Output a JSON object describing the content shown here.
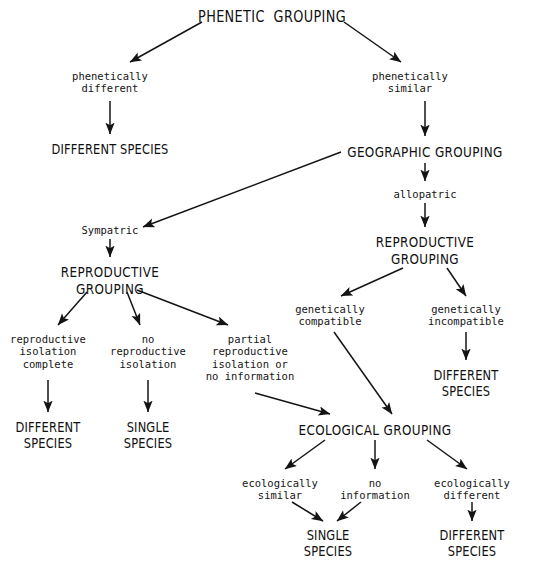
{
  "diagram": {
    "title": "PHENETIC GROUPING",
    "type": "flowchart",
    "background_color": "#ffffff",
    "ink_color": "#101010"
  },
  "nodes": {
    "phenetic_grouping": {
      "label": "PHENETIC  GROUPING",
      "x": 272,
      "y": 8,
      "style": "caps big"
    },
    "phenetically_different": {
      "label": "phenetically\ndifferent",
      "x": 110,
      "y": 70,
      "style": "cond"
    },
    "phenetically_similar": {
      "label": "phenetically\nsimilar",
      "x": 410,
      "y": 70,
      "style": "cond"
    },
    "different_species_1": {
      "label": "DIFFERENT SPECIES",
      "x": 110,
      "y": 142,
      "style": "term"
    },
    "geographic_grouping": {
      "label": "GEOGRAPHIC GROUPING",
      "x": 425,
      "y": 144,
      "style": "caps"
    },
    "allopatric": {
      "label": "allopatric",
      "x": 425,
      "y": 188,
      "style": "cond"
    },
    "reproductive_grouping_right": {
      "label": "REPRODUCTIVE\nGROUPING",
      "x": 425,
      "y": 234,
      "style": "caps"
    },
    "sympatric": {
      "label": "Sympatric",
      "x": 110,
      "y": 224,
      "style": "cond"
    },
    "reproductive_grouping_left": {
      "label": "REPRODUCTIVE\nGROUPING",
      "x": 110,
      "y": 264,
      "style": "caps"
    },
    "reproductive_isolation_complete": {
      "label": "reproductive\nisolation\ncomplete",
      "x": 48,
      "y": 333,
      "style": "cond"
    },
    "no_reproductive_isolation": {
      "label": "no\nreproductive\nisolation",
      "x": 148,
      "y": 333,
      "style": "cond"
    },
    "partial_reproductive_isolation": {
      "label": "partial\nreproductive\nisolation or\nno information",
      "x": 250,
      "y": 333,
      "style": "cond"
    },
    "different_species_2": {
      "label": "DIFFERENT\nSPECIES",
      "x": 48,
      "y": 420,
      "style": "term"
    },
    "single_species_1": {
      "label": "SINGLE\nSPECIES",
      "x": 148,
      "y": 420,
      "style": "term"
    },
    "genetically_compatible": {
      "label": "genetically\ncompatible",
      "x": 330,
      "y": 303,
      "style": "cond"
    },
    "genetically_incompatible": {
      "label": "genetically\nincompatible",
      "x": 466,
      "y": 303,
      "style": "cond"
    },
    "different_species_3": {
      "label": "DIFFERENT\nSPECIES",
      "x": 466,
      "y": 368,
      "style": "term"
    },
    "ecological_grouping": {
      "label": "ECOLOGICAL GROUPING",
      "x": 375,
      "y": 422,
      "style": "caps"
    },
    "ecologically_similar": {
      "label": "ecologically\nsimilar",
      "x": 280,
      "y": 477,
      "style": "cond"
    },
    "no_information": {
      "label": "no\ninformation",
      "x": 375,
      "y": 477,
      "style": "cond"
    },
    "ecologically_different": {
      "label": "ecologically\ndifferent",
      "x": 472,
      "y": 477,
      "style": "cond"
    },
    "single_species_2": {
      "label": "SINGLE\nSPECIES",
      "x": 328,
      "y": 528,
      "style": "term"
    },
    "different_species_4": {
      "label": "DIFFERENT\nSPECIES",
      "x": 472,
      "y": 528,
      "style": "term"
    }
  },
  "edges": [
    {
      "name": "phenetic-to-different",
      "from": "phenetic_grouping",
      "to": "phenetically_different",
      "x1": 202,
      "y1": 22,
      "x2": 130,
      "y2": 62
    },
    {
      "name": "phenetic-to-similar",
      "from": "phenetic_grouping",
      "to": "phenetically_similar",
      "x1": 344,
      "y1": 22,
      "x2": 401,
      "y2": 62
    },
    {
      "name": "different-to-species",
      "from": "phenetically_different",
      "to": "different_species_1",
      "x1": 110,
      "y1": 101,
      "x2": 110,
      "y2": 134
    },
    {
      "name": "similar-to-geographic",
      "from": "phenetically_similar",
      "to": "geographic_grouping",
      "x1": 425,
      "y1": 101,
      "x2": 425,
      "y2": 136
    },
    {
      "name": "geographic-to-sympatric",
      "from": "geographic_grouping",
      "to": "sympatric",
      "x1": 341,
      "y1": 152,
      "x2": 143,
      "y2": 227
    },
    {
      "name": "geographic-to-allopatric",
      "from": "geographic_grouping",
      "to": "allopatric",
      "x1": 425,
      "y1": 163,
      "x2": 425,
      "y2": 181
    },
    {
      "name": "allopatric-to-reproductive",
      "from": "allopatric",
      "to": "reproductive_grouping_right",
      "x1": 425,
      "y1": 203,
      "x2": 425,
      "y2": 227
    },
    {
      "name": "sympatric-to-reproductive",
      "from": "sympatric",
      "to": "reproductive_grouping_left",
      "x1": 110,
      "y1": 239,
      "x2": 110,
      "y2": 257
    },
    {
      "name": "reproductive-left-to-isolation-complete",
      "from": "reproductive_grouping_left",
      "to": "reproductive_isolation_complete",
      "x1": 87,
      "y1": 292,
      "x2": 58,
      "y2": 325
    },
    {
      "name": "reproductive-left-to-no-isolation",
      "from": "reproductive_grouping_left",
      "to": "no_reproductive_isolation",
      "x1": 127,
      "y1": 292,
      "x2": 140,
      "y2": 325
    },
    {
      "name": "reproductive-left-to-partial",
      "from": "reproductive_grouping_left",
      "to": "partial_reproductive_isolation",
      "x1": 137,
      "y1": 290,
      "x2": 228,
      "y2": 325
    },
    {
      "name": "isolation-complete-to-different-species",
      "from": "reproductive_isolation_complete",
      "to": "different_species_2",
      "x1": 48,
      "y1": 380,
      "x2": 48,
      "y2": 412
    },
    {
      "name": "no-isolation-to-single-species",
      "from": "no_reproductive_isolation",
      "to": "single_species_1",
      "x1": 148,
      "y1": 380,
      "x2": 148,
      "y2": 412
    },
    {
      "name": "partial-to-ecological",
      "from": "partial_reproductive_isolation",
      "to": "ecological_grouping",
      "x1": 255,
      "y1": 393,
      "x2": 330,
      "y2": 414
    },
    {
      "name": "reproductive-right-to-compatible",
      "from": "reproductive_grouping_right",
      "to": "genetically_compatible",
      "x1": 403,
      "y1": 268,
      "x2": 341,
      "y2": 296
    },
    {
      "name": "reproductive-right-to-incompatible",
      "from": "reproductive_grouping_right",
      "to": "genetically_incompatible",
      "x1": 447,
      "y1": 268,
      "x2": 466,
      "y2": 296
    },
    {
      "name": "incompatible-to-different-species",
      "from": "genetically_incompatible",
      "to": "different_species_3",
      "x1": 466,
      "y1": 332,
      "x2": 466,
      "y2": 360
    },
    {
      "name": "compatible-to-ecological",
      "from": "genetically_compatible",
      "to": "ecological_grouping",
      "x1": 334,
      "y1": 332,
      "x2": 392,
      "y2": 414
    },
    {
      "name": "ecological-to-similar",
      "from": "ecological_grouping",
      "to": "ecologically_similar",
      "x1": 325,
      "y1": 440,
      "x2": 285,
      "y2": 469
    },
    {
      "name": "ecological-to-no-information",
      "from": "ecological_grouping",
      "to": "no_information",
      "x1": 375,
      "y1": 440,
      "x2": 375,
      "y2": 469
    },
    {
      "name": "ecological-to-different",
      "from": "ecological_grouping",
      "to": "ecologically_different",
      "x1": 427,
      "y1": 440,
      "x2": 467,
      "y2": 469
    },
    {
      "name": "similar-to-single-species",
      "from": "ecologically_similar",
      "to": "single_species_2",
      "x1": 292,
      "y1": 502,
      "x2": 323,
      "y2": 521
    },
    {
      "name": "no-information-to-single-species",
      "from": "no_information",
      "to": "single_species_2",
      "x1": 361,
      "y1": 502,
      "x2": 337,
      "y2": 521
    },
    {
      "name": "different-to-different-species",
      "from": "ecologically_different",
      "to": "different_species_4",
      "x1": 472,
      "y1": 502,
      "x2": 472,
      "y2": 521
    }
  ]
}
